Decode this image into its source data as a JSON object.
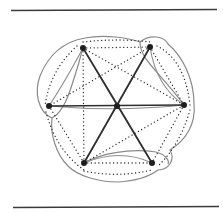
{
  "figure": {
    "rules": {
      "top": {
        "x1": 11,
        "y1": 10.5,
        "x2": 217,
        "y2": 9.5
      },
      "bottom": {
        "x1": 13,
        "y1": 207.5,
        "x2": 219,
        "y2": 206.5
      }
    },
    "nodes": [
      {
        "id": "TL",
        "x": 83,
        "y": 48
      },
      {
        "id": "TR",
        "x": 150,
        "y": 47
      },
      {
        "id": "L",
        "x": 49,
        "y": 106
      },
      {
        "id": "C",
        "x": 117,
        "y": 106
      },
      {
        "id": "R",
        "x": 184,
        "y": 105
      },
      {
        "id": "BL",
        "x": 84,
        "y": 163
      },
      {
        "id": "BR",
        "x": 152,
        "y": 163
      }
    ],
    "solid_edges": [
      {
        "from": "TL",
        "to": "BR"
      },
      {
        "from": "TR",
        "to": "BL"
      },
      {
        "from": "L",
        "to": "R"
      }
    ],
    "light_curves": [
      "M83,48 Q118,104 152,163",
      "M150,47 Q116,108 84,163",
      "M49,106 Q117,112 184,105",
      "M49,106 Q66,80 83,48",
      "M150,47 Q156,86 184,105",
      "M84,163 Q120,148 152,163"
    ],
    "dotted_edges": [
      {
        "from": "TL",
        "to": "TR"
      },
      {
        "from": "TL",
        "to": "BL"
      },
      {
        "from": "TL",
        "to": "R"
      },
      {
        "from": "TR",
        "to": "L"
      },
      {
        "from": "L",
        "to": "BL"
      },
      {
        "from": "BL",
        "to": "R"
      },
      {
        "from": "BL",
        "to": "BR"
      },
      {
        "from": "R",
        "to": "BR"
      },
      {
        "from": "TR",
        "to": "R"
      }
    ],
    "dotted_curves": [
      "M83,42 Q118,38 150,42",
      "M77,46 Q50,70 45,106",
      "M46,112 Q56,150 84,170",
      "M84,171 Q118,178 152,170",
      "M157,46 Q185,60 190,105",
      "M190,110 Q180,145 158,166"
    ],
    "hull_paths": [
      "M52,118 C38,112 34,92 40,76 C48,56 62,42 85,38 C105,34 128,38 140,42 C150,34 164,36 168,44 C182,56 194,78 194,104 C196,124 186,140 170,150 C176,160 168,170 158,170 C150,176 136,181 118,182 C98,182 78,176 68,166 C56,154 50,134 52,118 Z",
      "M52,118 C64,112 70,92 76,72 C80,60 82,50 83,48",
      "M140,42 C140,60 160,72 184,105",
      "M84,163 C100,154 128,148 156,152 C164,154 170,160 168,164"
    ],
    "colors": {
      "rule": "#3a3a3a",
      "hull": "#8a8a8a",
      "solid_edge": "#2e2e2e",
      "light_edge": "#8c8c8c",
      "node": "#1e1e1e",
      "background": "#ffffff"
    }
  }
}
